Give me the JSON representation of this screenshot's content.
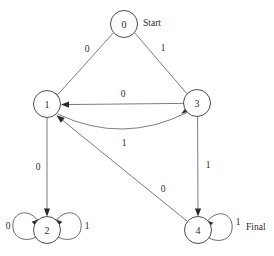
{
  "diagram": {
    "type": "state-machine",
    "canvas": {
      "width": 274,
      "height": 256
    },
    "colors": {
      "background": "#ffffff",
      "node_stroke": "#3a3a3a",
      "edge_stroke": "#6e6e6e",
      "arrow_fill": "#2a2a2a",
      "text": "#2b2b2b"
    },
    "nodes": [
      {
        "id": "0",
        "label": "0",
        "cx": 124,
        "cy": 24,
        "r": 13.5,
        "role": "start"
      },
      {
        "id": "1",
        "label": "1",
        "cx": 47,
        "cy": 104,
        "r": 13.5,
        "role": "normal"
      },
      {
        "id": "3",
        "label": "3",
        "cx": 197,
        "cy": 103,
        "r": 13.5,
        "role": "normal"
      },
      {
        "id": "2",
        "label": "2",
        "cx": 47,
        "cy": 230,
        "r": 13.5,
        "role": "normal"
      },
      {
        "id": "4",
        "label": "4",
        "cx": 198,
        "cy": 230,
        "r": 13.5,
        "role": "final"
      }
    ],
    "edges": [
      {
        "id": "e0-1",
        "from": "0",
        "to": "1",
        "label": "0",
        "label_x": 87,
        "label_y": 49,
        "kind": "straight"
      },
      {
        "id": "e0-3",
        "from": "0",
        "to": "3",
        "label": "1",
        "label_x": 163,
        "label_y": 48,
        "kind": "straight"
      },
      {
        "id": "e3-1",
        "from": "3",
        "to": "1",
        "label": "0",
        "label_x": 123,
        "label_y": 94,
        "kind": "straight"
      },
      {
        "id": "e1-3",
        "from": "1",
        "to": "3",
        "label": "1",
        "label_x": 124,
        "label_y": 143,
        "kind": "curved"
      },
      {
        "id": "e1-2",
        "from": "1",
        "to": "2",
        "label": "0",
        "label_x": 38,
        "label_y": 167,
        "kind": "straight"
      },
      {
        "id": "e3-4",
        "from": "3",
        "to": "4",
        "label": "1",
        "label_x": 208,
        "label_y": 165,
        "kind": "straight"
      },
      {
        "id": "e4-1",
        "from": "4",
        "to": "1",
        "label": "0",
        "label_x": 163,
        "label_y": 189,
        "kind": "straight"
      },
      {
        "id": "e2-2-l",
        "from": "2",
        "to": "2",
        "label": "0",
        "label_x": 8,
        "label_y": 226,
        "kind": "self-loop-left"
      },
      {
        "id": "e2-2-r",
        "from": "2",
        "to": "2",
        "label": "1",
        "label_x": 87,
        "label_y": 226,
        "kind": "self-loop-right"
      },
      {
        "id": "e4-4-r",
        "from": "4",
        "to": "4",
        "label": "1",
        "label_x": 238,
        "label_y": 222,
        "kind": "self-loop-right"
      }
    ],
    "annotations": [
      {
        "id": "start-annotation",
        "text": "Start",
        "x": 143,
        "y": 23
      },
      {
        "id": "final-annotation",
        "text": "Final",
        "x": 246,
        "y": 227
      }
    ]
  }
}
